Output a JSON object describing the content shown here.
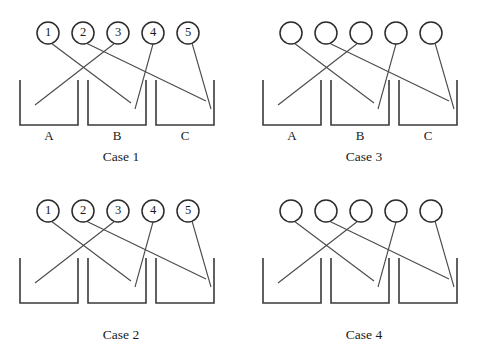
{
  "figure": {
    "title": "",
    "ball_count": 5,
    "box_count": 3,
    "colors": {
      "background": "#ffffff",
      "outline": "#3a3a3a",
      "ball_outline": "#2b2b2b",
      "connector": "#4a4a4a",
      "text": "#1a1a1a"
    }
  },
  "geometry": {
    "ball_cx": [
      48,
      83,
      118,
      153,
      188
    ],
    "ball_cy": 33,
    "ball_r": 11,
    "box_tops": 80,
    "box_bottom": 125,
    "boxes_x": [
      [
        20,
        78
      ],
      [
        88,
        146
      ],
      [
        156,
        214
      ]
    ],
    "label_y": 140,
    "case_label_y": 161
  },
  "assignment": {
    "description": "ball index -> box letter",
    "pairs": [
      {
        "ball": "1",
        "box": "B"
      },
      {
        "ball": "2",
        "box": "C"
      },
      {
        "ball": "3",
        "box": "A"
      },
      {
        "ball": "4",
        "box": "B"
      },
      {
        "ball": "5",
        "box": "C"
      }
    ],
    "endpoints": [
      {
        "x1": 51,
        "y1": 43,
        "x2": 131,
        "y2": 103
      },
      {
        "x1": 86,
        "y1": 43,
        "x2": 206,
        "y2": 101
      },
      {
        "x1": 115,
        "y1": 43,
        "x2": 35,
        "y2": 105
      },
      {
        "x1": 153,
        "y1": 44,
        "x2": 135,
        "y2": 109
      },
      {
        "x1": 192,
        "y1": 43,
        "x2": 211,
        "y2": 109
      }
    ]
  },
  "panels": [
    {
      "id": "case-1",
      "case_label": "Case 1",
      "balls_labeled": true,
      "boxes_labeled": true,
      "balls": [
        "1",
        "2",
        "3",
        "4",
        "5"
      ],
      "boxes": [
        "A",
        "B",
        "C"
      ]
    },
    {
      "id": "case-3",
      "case_label": "Case 3",
      "balls_labeled": false,
      "boxes_labeled": true,
      "balls": [
        "",
        "",
        "",
        "",
        ""
      ],
      "boxes": [
        "A",
        "B",
        "C"
      ]
    },
    {
      "id": "case-2",
      "case_label": "Case 2",
      "balls_labeled": true,
      "boxes_labeled": false,
      "balls": [
        "1",
        "2",
        "3",
        "4",
        "5"
      ],
      "boxes": [
        "",
        "",
        ""
      ]
    },
    {
      "id": "case-4",
      "case_label": "Case 4",
      "balls_labeled": false,
      "boxes_labeled": false,
      "balls": [
        "",
        "",
        "",
        "",
        ""
      ],
      "boxes": [
        "",
        "",
        ""
      ]
    }
  ]
}
